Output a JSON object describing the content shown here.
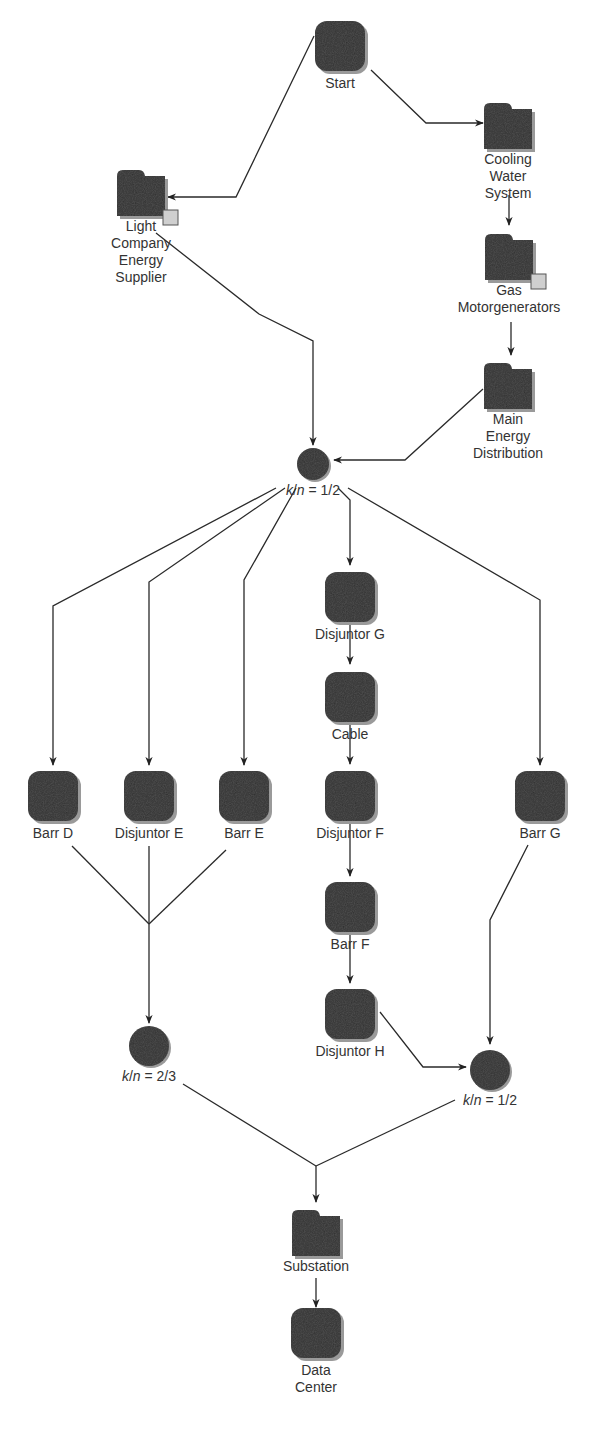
{
  "diagram": {
    "colors": {
      "node_fill": "#2e2e2e",
      "node_shadow": "#9a9a9a",
      "edge": "#2a2a2a",
      "text": "#333333",
      "subsystem_badge": "#cfcfcf"
    },
    "nodes": [
      {
        "id": "start",
        "type": "block",
        "label": "Start",
        "x": 340,
        "y": 46
      },
      {
        "id": "cooling",
        "type": "folder",
        "label": "Cooling\nWater\nSystem",
        "x": 508,
        "y": 126
      },
      {
        "id": "light",
        "type": "folder",
        "label": "Light\nCompany\nEnergy\nSupplier",
        "x": 141,
        "y": 193,
        "badge": true
      },
      {
        "id": "gas",
        "type": "folder",
        "label": "Gas\nMotorgenerators",
        "x": 509,
        "y": 257,
        "badge": true
      },
      {
        "id": "main",
        "type": "folder",
        "label": "Main\nEnergy\nDistribution",
        "x": 508,
        "y": 386
      },
      {
        "id": "kn1",
        "type": "gate",
        "label": "k/n = 1/2",
        "x": 313,
        "y": 464
      },
      {
        "id": "disjG",
        "type": "block",
        "label": "Disjuntor G",
        "x": 350,
        "y": 597
      },
      {
        "id": "cable",
        "type": "block",
        "label": "Cable",
        "x": 350,
        "y": 697
      },
      {
        "id": "barrD",
        "type": "block",
        "label": "Barr D",
        "x": 53,
        "y": 796
      },
      {
        "id": "disjE",
        "type": "block",
        "label": "Disjuntor E",
        "x": 149,
        "y": 796
      },
      {
        "id": "barrE",
        "type": "block",
        "label": "Barr E",
        "x": 244,
        "y": 796
      },
      {
        "id": "disjF",
        "type": "block",
        "label": "Disjuntor F",
        "x": 350,
        "y": 796
      },
      {
        "id": "barrG",
        "type": "block",
        "label": "Barr G",
        "x": 540,
        "y": 796
      },
      {
        "id": "barrF",
        "type": "block",
        "label": "Barr F",
        "x": 350,
        "y": 907
      },
      {
        "id": "disjH",
        "type": "block",
        "label": "Disjuntor H",
        "x": 350,
        "y": 1014
      },
      {
        "id": "kn2",
        "type": "gate",
        "label": "k/n = 2/3",
        "x": 149,
        "y": 1046
      },
      {
        "id": "kn3",
        "type": "gate",
        "label": "k/n = 1/2",
        "x": 490,
        "y": 1070
      },
      {
        "id": "substation",
        "type": "folder",
        "label": "Substation",
        "x": 316,
        "y": 1233
      },
      {
        "id": "datacenter",
        "type": "block",
        "label": "Data\nCenter",
        "x": 316,
        "y": 1333
      }
    ],
    "edges": [
      {
        "from": "start",
        "to": "cooling",
        "points": [
          [
            371,
            70
          ],
          [
            426,
            123
          ],
          [
            483,
            123
          ]
        ],
        "arrow": true
      },
      {
        "from": "start",
        "to": "light",
        "points": [
          [
            314,
            36
          ],
          [
            236,
            197
          ],
          [
            168,
            197
          ]
        ],
        "arrow": true
      },
      {
        "from": "cooling",
        "to": "gas",
        "points": [
          [
            509,
            195
          ],
          [
            509,
            225
          ]
        ],
        "arrow": true
      },
      {
        "from": "gas",
        "to": "main",
        "points": [
          [
            511,
            322
          ],
          [
            511,
            355
          ]
        ],
        "arrow": true
      },
      {
        "from": "light",
        "to": "kn1",
        "points": [
          [
            156,
            233
          ],
          [
            259,
            314
          ],
          [
            313,
            341
          ],
          [
            313,
            445
          ]
        ],
        "arrow": true
      },
      {
        "from": "main",
        "to": "kn1",
        "points": [
          [
            483,
            389
          ],
          [
            405,
            460
          ],
          [
            334,
            460
          ]
        ],
        "arrow": true
      },
      {
        "from": "kn1",
        "to": "barrD",
        "points": [
          [
            276,
            488
          ],
          [
            53,
            606
          ],
          [
            53,
            765
          ]
        ],
        "arrow": true
      },
      {
        "from": "kn1",
        "to": "disjE",
        "points": [
          [
            285,
            488
          ],
          [
            149,
            582
          ],
          [
            149,
            765
          ]
        ],
        "arrow": true
      },
      {
        "from": "kn1",
        "to": "barrE",
        "points": [
          [
            296,
            488
          ],
          [
            244,
            580
          ],
          [
            244,
            765
          ]
        ],
        "arrow": true
      },
      {
        "from": "kn1",
        "to": "disjG",
        "points": [
          [
            338,
            488
          ],
          [
            350,
            500
          ],
          [
            350,
            565
          ]
        ],
        "arrow": true
      },
      {
        "from": "kn1",
        "to": "barrG",
        "points": [
          [
            348,
            488
          ],
          [
            540,
            600
          ],
          [
            540,
            765
          ]
        ],
        "arrow": true
      },
      {
        "from": "disjG",
        "to": "cable",
        "points": [
          [
            350,
            625
          ],
          [
            350,
            664
          ]
        ],
        "arrow": true
      },
      {
        "from": "cable",
        "to": "disjF",
        "points": [
          [
            350,
            720
          ],
          [
            350,
            764
          ]
        ],
        "arrow": true
      },
      {
        "from": "disjF",
        "to": "barrF",
        "points": [
          [
            350,
            822
          ],
          [
            350,
            876
          ]
        ],
        "arrow": true
      },
      {
        "from": "barrF",
        "to": "disjH",
        "points": [
          [
            350,
            930
          ],
          [
            350,
            983
          ]
        ],
        "arrow": true
      },
      {
        "from": "barrD",
        "to": "join1",
        "points": [
          [
            72,
            846
          ],
          [
            149,
            924
          ]
        ],
        "arrow": false
      },
      {
        "from": "barrE",
        "to": "join1",
        "points": [
          [
            226,
            850
          ],
          [
            149,
            924
          ]
        ],
        "arrow": false
      },
      {
        "from": "disjE",
        "to": "kn2",
        "points": [
          [
            149,
            846
          ],
          [
            149,
            1023
          ]
        ],
        "arrow": true
      },
      {
        "from": "disjH",
        "to": "kn3",
        "points": [
          [
            380,
            1012
          ],
          [
            423,
            1067
          ],
          [
            466,
            1067
          ]
        ],
        "arrow": true
      },
      {
        "from": "barrG",
        "to": "kn3",
        "points": [
          [
            528,
            845
          ],
          [
            490,
            920
          ],
          [
            490,
            1044
          ]
        ],
        "arrow": true
      },
      {
        "from": "kn2",
        "to": "join2",
        "points": [
          [
            183,
            1084
          ],
          [
            316,
            1166
          ]
        ],
        "arrow": false
      },
      {
        "from": "kn3",
        "to": "join2",
        "points": [
          [
            455,
            1100
          ],
          [
            316,
            1166
          ]
        ],
        "arrow": false
      },
      {
        "from": "join2",
        "to": "substation",
        "points": [
          [
            316,
            1166
          ],
          [
            316,
            1202
          ]
        ],
        "arrow": true
      },
      {
        "from": "substation",
        "to": "datacenter",
        "points": [
          [
            316,
            1278
          ],
          [
            316,
            1307
          ]
        ],
        "arrow": true
      }
    ]
  }
}
